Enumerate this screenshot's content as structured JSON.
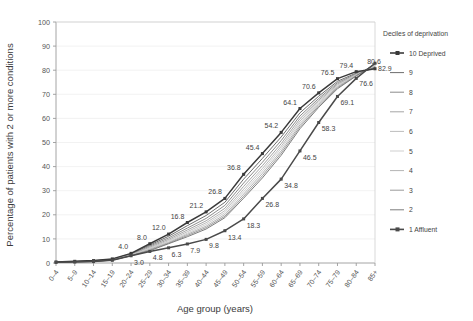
{
  "chart_data": {
    "type": "line",
    "title": "",
    "xlabel": "Age group (years)",
    "ylabel": "Percentage of patients with 2 or more conditions",
    "ylim": [
      0,
      100
    ],
    "yticks": [
      0,
      10,
      20,
      30,
      40,
      50,
      60,
      70,
      80,
      90,
      100
    ],
    "grid": true,
    "legend_position": "right",
    "legend_title": "Deciles of deprivation",
    "categories": [
      "0–4",
      "5–9",
      "10–14",
      "15–19",
      "20–24",
      "25–29",
      "30–34",
      "35–39",
      "40–44",
      "45–49",
      "50–54",
      "55–59",
      "60–64",
      "65–69",
      "70–74",
      "75–79",
      "80–84",
      "85+"
    ],
    "series": [
      {
        "name": "10 Deprived",
        "color": "#3a3a3a",
        "values": [
          0.4,
          0.7,
          1.0,
          1.7,
          4.0,
          8.0,
          12.0,
          16.8,
          21.2,
          26.8,
          36.8,
          45.4,
          54.2,
          64.1,
          70.6,
          76.5,
          79.4,
          80.6
        ],
        "labels": {
          "20–24": "4.0",
          "25–29": "8.0",
          "30–34": "12.0",
          "35–39": "16.8",
          "40–44": "21.2",
          "45–49": "26.8",
          "50–54": "36.8",
          "55–59": "45.4",
          "60–64": "54.2",
          "65–69": "64.1",
          "70–74": "70.6",
          "75–79": "76.5",
          "80–84": "79.4",
          "85+": "80.6"
        }
      },
      {
        "name": "9",
        "color": "#6e6e6e",
        "values": [
          0.4,
          0.6,
          0.9,
          1.6,
          3.8,
          7.4,
          11.1,
          15.5,
          19.7,
          25.2,
          34.8,
          43.4,
          52.3,
          62.3,
          69.2,
          75.4,
          78.8,
          80.9
        ]
      },
      {
        "name": "8",
        "color": "#8c8c8c",
        "values": [
          0.4,
          0.6,
          0.9,
          1.5,
          3.6,
          7.0,
          10.4,
          14.5,
          18.5,
          23.9,
          33.2,
          41.8,
          50.8,
          61.0,
          68.3,
          74.8,
          78.5,
          81.2
        ]
      },
      {
        "name": "7",
        "color": "#a5a5a5",
        "values": [
          0.4,
          0.6,
          0.8,
          1.4,
          3.4,
          6.6,
          9.8,
          13.7,
          17.5,
          22.7,
          31.8,
          40.4,
          49.5,
          59.9,
          67.6,
          74.3,
          78.3,
          81.6
        ]
      },
      {
        "name": "6",
        "color": "#bcbcbc",
        "values": [
          0.3,
          0.5,
          0.8,
          1.4,
          3.3,
          6.2,
          9.3,
          13.0,
          16.7,
          21.7,
          30.6,
          39.2,
          48.4,
          58.9,
          67.0,
          73.9,
          78.2,
          81.9
        ]
      },
      {
        "name": "5",
        "color": "#cfcfcf",
        "values": [
          0.3,
          0.5,
          0.7,
          1.3,
          3.2,
          6.0,
          8.9,
          12.4,
          16.0,
          20.9,
          29.6,
          38.2,
          47.5,
          58.1,
          66.4,
          73.5,
          78.0,
          82.1
        ]
      },
      {
        "name": "4",
        "color": "#b4b4b4",
        "values": [
          0.3,
          0.5,
          0.7,
          1.3,
          3.1,
          5.7,
          8.5,
          11.9,
          15.3,
          20.1,
          28.6,
          37.2,
          46.5,
          57.3,
          65.8,
          73.1,
          77.9,
          82.3
        ]
      },
      {
        "name": "3",
        "color": "#9a9a9a",
        "values": [
          0.3,
          0.5,
          0.7,
          1.2,
          3.0,
          5.4,
          8.2,
          11.4,
          14.7,
          19.4,
          27.7,
          36.2,
          45.6,
          56.5,
          65.2,
          72.7,
          77.7,
          82.5
        ]
      },
      {
        "name": "2",
        "color": "#7d7d7d",
        "values": [
          0.3,
          0.4,
          0.6,
          1.2,
          3.0,
          5.1,
          8.0,
          10.9,
          14.1,
          18.8,
          26.9,
          35.3,
          44.7,
          55.7,
          64.6,
          72.3,
          77.6,
          82.7
        ]
      },
      {
        "name": "1 Affluent",
        "color": "#4a4a4a",
        "values": [
          0.3,
          0.4,
          0.6,
          1.1,
          3.0,
          4.8,
          6.3,
          7.9,
          9.8,
          13.4,
          18.3,
          26.8,
          34.8,
          46.5,
          58.3,
          69.1,
          76.6,
          82.9
        ],
        "labels": {
          "20–24": "3.0",
          "25–29": "4.8",
          "30–34": "6.3",
          "35–39": "7.9",
          "40–44": "9.8",
          "45–49": "13.4",
          "50–54": "18.3",
          "55–59": "26.8",
          "60–64": "34.8",
          "65–69": "46.5",
          "70–74": "58.3",
          "75–79": "69.1",
          "80–84": "76.6",
          "85+": "82.9"
        }
      }
    ]
  },
  "legend": {
    "title": "Deciles of deprivation",
    "items": [
      {
        "label": "10 Deprived",
        "color": "#3a3a3a",
        "marker": true
      },
      {
        "label": "9",
        "color": "#6e6e6e",
        "marker": false
      },
      {
        "label": "8",
        "color": "#8c8c8c",
        "marker": false
      },
      {
        "label": "7",
        "color": "#a5a5a5",
        "marker": false
      },
      {
        "label": "6",
        "color": "#bcbcbc",
        "marker": false
      },
      {
        "label": "5",
        "color": "#cfcfcf",
        "marker": false
      },
      {
        "label": "4",
        "color": "#b4b4b4",
        "marker": false
      },
      {
        "label": "3",
        "color": "#9a9a9a",
        "marker": false
      },
      {
        "label": "2",
        "color": "#7d7d7d",
        "marker": false
      },
      {
        "label": "1 Affluent",
        "color": "#4a4a4a",
        "marker": true
      }
    ]
  },
  "axes": {
    "y_title": "Percentage of patients with 2 or more conditions",
    "x_title": "Age group (years)"
  },
  "colors": {
    "axis": "#9a9a9a",
    "grid": "#efefef",
    "text": "#3b3b3b"
  }
}
